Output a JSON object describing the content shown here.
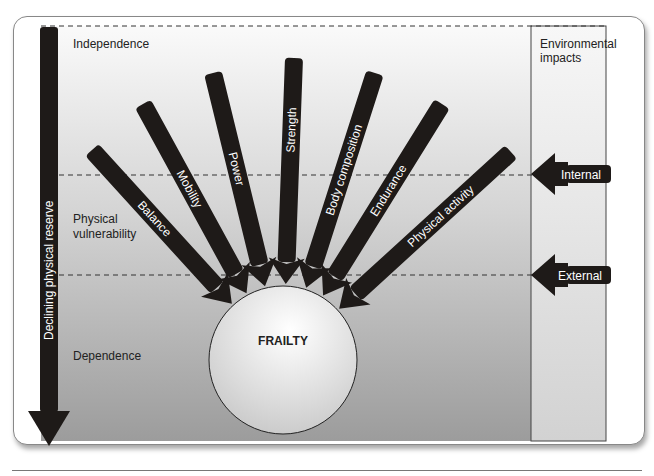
{
  "figure": {
    "vertical_axis_label": "Declining physical reserve",
    "zones": [
      {
        "label_lines": [
          "Independence"
        ]
      },
      {
        "label_lines": [
          "Physical",
          "vulnerability"
        ]
      },
      {
        "label_lines": [
          "Dependence"
        ]
      }
    ],
    "center_label": "FRAILTY",
    "factors": [
      "Balance",
      "Mobility",
      "Power",
      "Strength",
      "Body composition",
      "Endurance",
      "Physical activity"
    ],
    "environment": {
      "title_lines": [
        "Environmental",
        "impacts"
      ],
      "arrows": [
        "Internal",
        "External"
      ]
    },
    "colors": {
      "arrow": "#1e1a18",
      "text_on_arrow": "#ffffff",
      "bg_top": "#f7f7f7",
      "bg_bottom": "#9a9a9a"
    }
  }
}
